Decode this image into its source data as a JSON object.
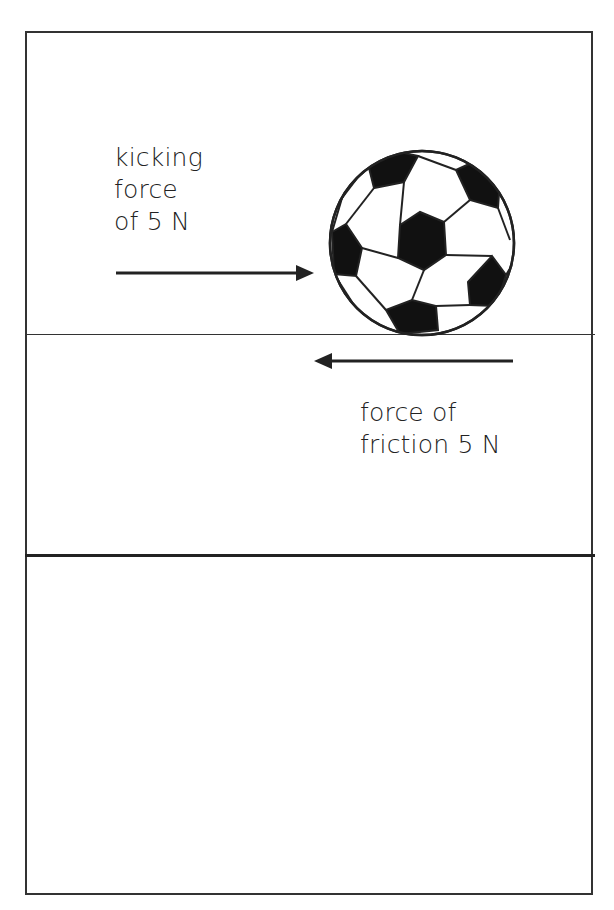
{
  "diagram": {
    "kicking_force": {
      "lines": [
        "kicking",
        "force",
        "of 5 N"
      ],
      "direction": "right",
      "magnitude_newtons": 5
    },
    "friction_force": {
      "lines": [
        "force of",
        "friction 5 N"
      ],
      "direction": "left",
      "magnitude_newtons": 5
    },
    "object": "soccer-ball",
    "colors": {
      "ink": "#222222",
      "background": "#ffffff"
    }
  }
}
